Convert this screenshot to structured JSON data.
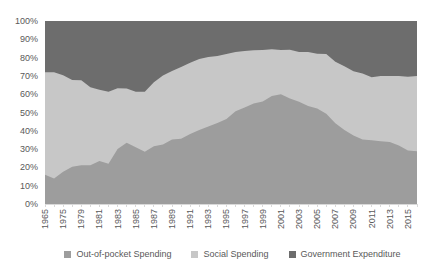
{
  "chart_data": {
    "type": "area",
    "stacked_percent": true,
    "x": [
      1965,
      1970,
      1975,
      1978,
      1979,
      1980,
      1981,
      1982,
      1983,
      1984,
      1985,
      1986,
      1987,
      1988,
      1989,
      1990,
      1991,
      1992,
      1993,
      1994,
      1995,
      1996,
      1997,
      1998,
      1999,
      2000,
      2001,
      2002,
      2003,
      2004,
      2005,
      2006,
      2007,
      2008,
      2009,
      2010,
      2011,
      2012,
      2013,
      2014,
      2015,
      2016
    ],
    "x_tick_labels": [
      "1965",
      "1975",
      "1979",
      "1981",
      "1983",
      "1985",
      "1987",
      "1989",
      "1991",
      "1993",
      "1995",
      "1997",
      "1999",
      "2001",
      "2003",
      "2005",
      "2007",
      "2009",
      "2011",
      "2013",
      "2015"
    ],
    "x_label_every": 2,
    "y_tick_labels": [
      "0%",
      "10%",
      "20%",
      "30%",
      "40%",
      "50%",
      "60%",
      "70%",
      "80%",
      "90%",
      "100%"
    ],
    "ylim": [
      0,
      100
    ],
    "grid": false,
    "legend_position": "bottom",
    "axis_color": "#d9d9d9",
    "tick_label_color": "#595959",
    "series": [
      {
        "name": "Out-of-pocket Spending",
        "color": "#9d9d9d",
        "values": [
          16.0,
          14.0,
          17.6,
          20.4,
          21.2,
          21.2,
          23.5,
          22.0,
          30.0,
          33.5,
          31.0,
          28.5,
          31.5,
          32.5,
          35.3,
          35.7,
          38.2,
          40.4,
          42.3,
          44.3,
          46.4,
          50.7,
          52.8,
          54.9,
          56.0,
          59.0,
          60.0,
          57.7,
          55.9,
          53.6,
          52.2,
          49.3,
          44.1,
          40.4,
          37.5,
          35.3,
          34.8,
          34.3,
          33.9,
          32.0,
          29.3,
          28.8
        ]
      },
      {
        "name": "Social Spending",
        "color": "#c7c7c7",
        "values": [
          56.0,
          58.0,
          52.8,
          47.4,
          46.4,
          42.6,
          39.0,
          39.4,
          33.3,
          29.6,
          30.4,
          32.8,
          35.0,
          37.7,
          37.4,
          39.2,
          39.0,
          38.8,
          38.0,
          36.6,
          35.6,
          32.3,
          30.8,
          29.1,
          28.2,
          25.5,
          24.1,
          26.6,
          27.1,
          29.4,
          29.9,
          32.6,
          33.6,
          34.9,
          35.0,
          36.0,
          34.5,
          35.7,
          36.0,
          38.0,
          40.2,
          41.2
        ]
      },
      {
        "name": "Government Expenditure",
        "color": "#6d6d6d",
        "values": [
          28.0,
          28.0,
          29.6,
          32.2,
          32.4,
          36.2,
          37.5,
          38.6,
          36.7,
          36.9,
          38.6,
          38.7,
          33.5,
          29.8,
          27.3,
          25.1,
          22.8,
          20.8,
          19.7,
          19.1,
          18.0,
          17.0,
          16.4,
          16.0,
          15.8,
          15.5,
          15.9,
          15.7,
          17.0,
          17.0,
          17.9,
          18.1,
          22.3,
          24.7,
          27.5,
          28.7,
          30.7,
          30.0,
          30.1,
          30.0,
          30.5,
          30.0
        ]
      }
    ]
  }
}
